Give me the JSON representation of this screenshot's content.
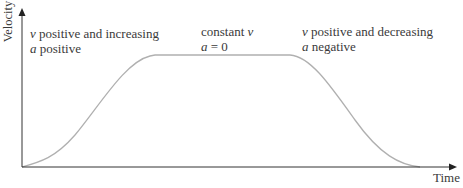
{
  "axes": {
    "y_label": "Velocity",
    "x_label": "Time"
  },
  "annotations": [
    {
      "line1_var": "v",
      "line1_text": " positive and increasing",
      "line2_var": "a",
      "line2_text": " positive"
    },
    {
      "line1_text": "constant ",
      "line1_var": "v",
      "line2_var": "a",
      "line2_text": " = 0"
    },
    {
      "line1_var": "v",
      "line1_text": " positive and decreasing",
      "line2_var": "a",
      "line2_text": " negative"
    }
  ],
  "colors": {
    "axis": "#333333",
    "curve": "#b0b0b0",
    "text": "#3a3a3a"
  }
}
